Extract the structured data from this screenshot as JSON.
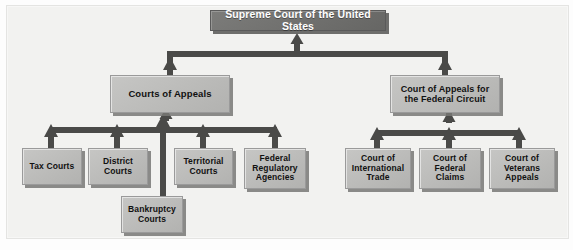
{
  "diagram": {
    "colors": {
      "root_fill": "#727270",
      "root_text": "#ffffff",
      "node_fill": "#bdbdbb",
      "node_text": "#111111",
      "connector": "#4a4a48",
      "background": "#f2f2f0"
    },
    "root": {
      "id": "supreme-court",
      "label": "Supreme Court of the United States",
      "x": 210,
      "y": 10,
      "w": 176,
      "h": 21,
      "font": 10.5
    },
    "level2": [
      {
        "id": "courts-of-appeals",
        "label": "Courts of Appeals",
        "x": 110,
        "y": 75,
        "w": 120,
        "h": 38,
        "font": 9.5
      },
      {
        "id": "court-of-appeals-federal-circuit",
        "label": "Court of Appeals for the Federal Circuit",
        "x": 390,
        "y": 75,
        "w": 110,
        "h": 38,
        "font": 9
      }
    ],
    "level3_left": [
      {
        "id": "tax-courts",
        "label": "Tax Courts",
        "x": 22,
        "y": 148,
        "w": 60,
        "h": 37,
        "font": 8.5
      },
      {
        "id": "district-courts",
        "label": "District Courts",
        "x": 88,
        "y": 148,
        "w": 60,
        "h": 37,
        "font": 8.5
      },
      {
        "id": "territorial-courts",
        "label": "Territorial Courts",
        "x": 174,
        "y": 148,
        "w": 59,
        "h": 37,
        "font": 8.5
      },
      {
        "id": "federal-regulatory-agencies",
        "label": "Federal Regulatory Agencies",
        "x": 244,
        "y": 148,
        "w": 62,
        "h": 41,
        "font": 8.5
      }
    ],
    "level3_right": [
      {
        "id": "court-of-international-trade",
        "label": "Court of International Trade",
        "x": 345,
        "y": 148,
        "w": 66,
        "h": 41,
        "font": 8.5
      },
      {
        "id": "court-of-federal-claims",
        "label": "Court of Federal Claims",
        "x": 419,
        "y": 148,
        "w": 62,
        "h": 41,
        "font": 8.5
      },
      {
        "id": "court-of-veterans-appeals",
        "label": "Court of Veterans Appeals",
        "x": 489,
        "y": 148,
        "w": 66,
        "h": 41,
        "font": 8.5
      }
    ],
    "level4": [
      {
        "id": "bankruptcy-courts",
        "label": "Bankruptcy Courts",
        "x": 121,
        "y": 196,
        "w": 62,
        "h": 37,
        "font": 8.5
      }
    ],
    "connectors": {
      "stroke": "#4a4a48",
      "bar_thickness": 6,
      "arrow_width": 11,
      "arrow_height": 10,
      "top_bus": {
        "y": 54,
        "x1": 167,
        "x2": 448,
        "center_x": 297
      },
      "left_bus": {
        "y": 130,
        "x1": 51,
        "x2": 277,
        "stems": [
          51,
          117,
          163,
          203,
          275
        ]
      },
      "right_bus": {
        "y": 133,
        "x1": 377,
        "x2": 519,
        "stems": [
          377,
          449,
          519
        ]
      },
      "bankruptcy_stem_x": 163
    }
  }
}
